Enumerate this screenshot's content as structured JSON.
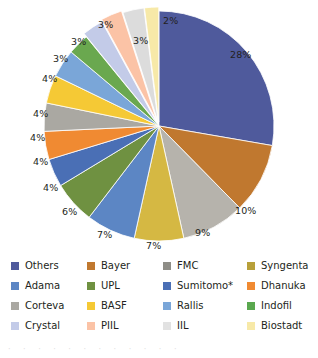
{
  "chart_data": {
    "type": "pie",
    "title": "",
    "subtitle": "",
    "xlabel": "",
    "ylabel": "",
    "legend_position": "bottom",
    "grid": false,
    "units": "percent",
    "start_angle_deg": 0,
    "direction": "clockwise",
    "categories": [
      "Others",
      "Bayer",
      "FMC",
      "Syngenta",
      "Adama",
      "UPL",
      "Sumitomo*",
      "Dhanuka",
      "Corteva",
      "BASF",
      "Rallis",
      "Indofil",
      "Crystal",
      "PIIL",
      "IIL",
      "Biostadt"
    ],
    "values": [
      28,
      10,
      9,
      7,
      7,
      6,
      4,
      4,
      4,
      4,
      4,
      3,
      3,
      3,
      3,
      2
    ],
    "labels": [
      "28%",
      "10%",
      "9%",
      "7%",
      "7%",
      "6%",
      "4%",
      "4%",
      "4%",
      "4%",
      "4%",
      "3%",
      "3%",
      "3%",
      "3%",
      "2%"
    ],
    "colors": [
      "#4f5a9c",
      "#c0782f",
      "#b6b3ac",
      "#d5b843",
      "#5c86c4",
      "#6f9141",
      "#4a6fb5",
      "#f08a32",
      "#aaa8a2",
      "#f5c935",
      "#7aa6d8",
      "#6aa84f",
      "#c3cbe8",
      "#fbc3a6",
      "#dcdcdc",
      "#f7e9a8"
    ]
  },
  "legend": {
    "items": [
      {
        "label": "Others",
        "color": "#4f5a9c"
      },
      {
        "label": "Bayer",
        "color": "#c0782f"
      },
      {
        "label": "FMC",
        "color": "#8e8d87"
      },
      {
        "label": "Syngenta",
        "color": "#b8a03a"
      },
      {
        "label": "Adama",
        "color": "#5c86c4"
      },
      {
        "label": "UPL",
        "color": "#6f9141"
      },
      {
        "label": "Sumitomo*",
        "color": "#4a6fb5"
      },
      {
        "label": "Dhanuka",
        "color": "#f08a32"
      },
      {
        "label": "Corteva",
        "color": "#aaa8a2"
      },
      {
        "label": "BASF",
        "color": "#f5c935"
      },
      {
        "label": "Rallis",
        "color": "#7aa6d8"
      },
      {
        "label": "Indofil",
        "color": "#5aa84f"
      },
      {
        "label": "Crystal",
        "color": "#c3cbe8"
      },
      {
        "label": "PIIL",
        "color": "#fbc3a6"
      },
      {
        "label": "IIL",
        "color": "#e2e2e2"
      },
      {
        "label": "Biostadt",
        "color": "#f7e9a8"
      }
    ]
  },
  "slice_labels": [
    {
      "text": "28%",
      "left": 230,
      "top": 50
    },
    {
      "text": "10%",
      "left": 235,
      "top": 206
    },
    {
      "text": "9%",
      "left": 195,
      "top": 228
    },
    {
      "text": "7%",
      "left": 146,
      "top": 241
    },
    {
      "text": "7%",
      "left": 97,
      "top": 230
    },
    {
      "text": "6%",
      "left": 62,
      "top": 207
    },
    {
      "text": "4%",
      "left": 43,
      "top": 183
    },
    {
      "text": "4%",
      "left": 33,
      "top": 157
    },
    {
      "text": "4%",
      "left": 30,
      "top": 133
    },
    {
      "text": "4%",
      "left": 33,
      "top": 109
    },
    {
      "text": "4%",
      "left": 42,
      "top": 74
    },
    {
      "text": "3%",
      "left": 53,
      "top": 54
    },
    {
      "text": "3%",
      "left": 71,
      "top": 37
    },
    {
      "text": "3%",
      "left": 98,
      "top": 20
    },
    {
      "text": "3%",
      "left": 133,
      "top": 36
    },
    {
      "text": "2%",
      "left": 163,
      "top": 16
    }
  ],
  "bottom_artifact": "·  ·   ·  ·    ·  ·   ·  ·   ·  ·   ·  ·"
}
